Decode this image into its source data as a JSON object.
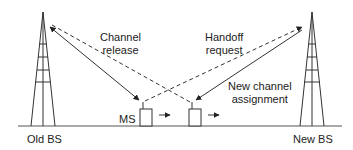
{
  "diagram": {
    "nodes": {
      "old_bs": "Old BS",
      "new_bs": "New BS",
      "ms": "MS"
    },
    "messages": {
      "channel_release_1": "Channel",
      "channel_release_2": "release",
      "handoff_request_1": "Handoff",
      "handoff_request_2": "request",
      "new_channel_1": "New channel",
      "new_channel_2": "assignment"
    },
    "colors": {
      "line": "#333333",
      "background": "#ffffff"
    }
  }
}
